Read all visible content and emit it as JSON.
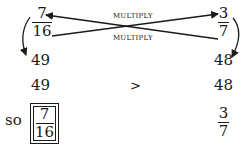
{
  "top": {
    "left_fraction": {
      "numerator": "7",
      "denominator": "16"
    },
    "right_fraction": {
      "numerator": "3",
      "denominator": "7"
    },
    "label_top": "MULTIPLY",
    "label_bottom": "MULTIPLY"
  },
  "products": {
    "left": "49",
    "right": "48"
  },
  "comparison": {
    "left": "49",
    "operator": ">",
    "right": "48"
  },
  "conclusion": {
    "prefix": "so",
    "answer_fraction": {
      "numerator": "7",
      "denominator": "16"
    },
    "other_fraction": {
      "numerator": "3",
      "denominator": "7"
    }
  },
  "colors": {
    "ink": "#1a1a1a",
    "background": "#ffffff"
  }
}
